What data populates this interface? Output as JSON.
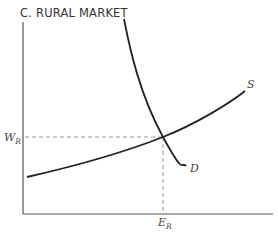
{
  "title": "C. RURAL MARKET",
  "labels": {
    "wage": "W",
    "wage_sub": "R",
    "employment": "E",
    "employment_sub": "R",
    "supply": "S",
    "demand": "D"
  },
  "colors": {
    "curve": "#222222",
    "axis": "#555555",
    "dashed": "#999999"
  }
}
